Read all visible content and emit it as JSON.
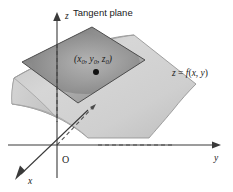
{
  "figure": {
    "title_label": "Tangent plane",
    "surface_label": "z = f(x, y)",
    "point_label": "(x0, y0, z0)",
    "point_label_parts": {
      "open": "(",
      "x_base": "x",
      "x_sub": "0",
      "comma1": ", ",
      "y_base": "y",
      "y_sub": "0",
      "comma2": ", ",
      "z_base": "z",
      "z_sub": "0",
      "close": ")"
    },
    "surface_label_parts": {
      "z": "z",
      "equals": " = ",
      "f": "f",
      "open": "(",
      "x": "x",
      "comma": ", ",
      "y": "y",
      "close": ")"
    },
    "axes": {
      "z_label": "z",
      "y_label": "y",
      "x_label": "x",
      "origin_label": "O"
    },
    "colors": {
      "background": "#ffffff",
      "tangent_plane_light": "#b4b4b4",
      "tangent_plane_dark": "#7b7b7b",
      "surface_light": "#dcdcdc",
      "surface_mid": "#c6c6c6",
      "surface_dark": "#b0b0b0",
      "axis_stroke": "#3a3a3a",
      "plane_outline": "#4e4e4e",
      "text": "#1a1a1a",
      "point_dot": "#111111"
    },
    "geometry": {
      "tangent_plane_points": "22,62 92,27 145,60 78,103",
      "origin": "57,145",
      "z_axis_top": "57,14",
      "y_axis_right": "220,145",
      "x_axis_end": "17,178"
    }
  }
}
